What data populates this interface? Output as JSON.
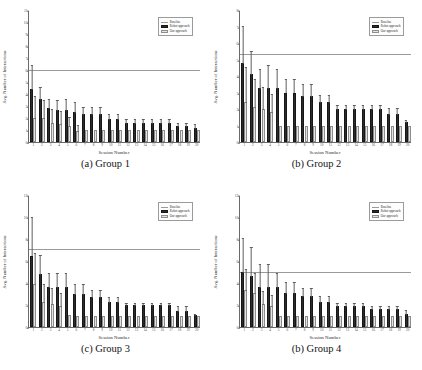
{
  "figure": {
    "panel_count": 4,
    "shared": {
      "xlabel": "Session Number",
      "ylabel": "Avg. Number of Interactions",
      "xticks": [
        "1",
        "2",
        "3",
        "4",
        "5",
        "6",
        "7",
        "8",
        "9",
        "10",
        "11",
        "12",
        "13",
        "14",
        "15",
        "16",
        "17",
        "18",
        "19",
        "20"
      ],
      "legend": [
        {
          "label": "Baseline",
          "type": "line",
          "color": "#9a9a9a"
        },
        {
          "label": "Robot approach",
          "type": "bar",
          "color": "#2b2b2b"
        },
        {
          "label": "Our approach",
          "type": "bar",
          "color": "#e4e4e4"
        }
      ]
    },
    "panels": [
      {
        "caption": "(a) Group 1",
        "chart_data": {
          "type": "bar",
          "title": "(a) Group 1",
          "xlabel": "Session Number",
          "ylabel": "Avg. Number of Interactions",
          "categories": [
            "1",
            "2",
            "3",
            "4",
            "5",
            "6",
            "7",
            "8",
            "9",
            "10",
            "11",
            "12",
            "13",
            "14",
            "15",
            "16",
            "17",
            "18",
            "19",
            "20"
          ],
          "ylim": [
            0,
            11
          ],
          "yticks": [
            0,
            1,
            2,
            3,
            4,
            5,
            6,
            7,
            8,
            9,
            10,
            11
          ],
          "grid": false,
          "legend_position": "top-right",
          "baseline": 6.1,
          "series": [
            {
              "name": "Robot approach",
              "color": "#2b2b2b",
              "values": [
                4.4,
                3.6,
                2.8,
                2.7,
                2.7,
                2.5,
                2.3,
                2.3,
                2.3,
                1.9,
                1.9,
                1.6,
                1.6,
                1.6,
                1.6,
                1.6,
                1.6,
                1.3,
                1.3,
                1.2
              ],
              "errors": [
                2.1,
                1.1,
                0.9,
                0.9,
                1.0,
                0.9,
                0.7,
                0.7,
                0.7,
                0.5,
                0.5,
                0.4,
                0.4,
                0.4,
                0.4,
                0.4,
                0.4,
                0.4,
                0.4,
                0.4
              ]
            },
            {
              "name": "Our approach",
              "color": "#e4e4e4",
              "values": [
                2.0,
                2.0,
                1.6,
                1.5,
                1.3,
                0.9,
                1.0,
                1.0,
                1.0,
                1.0,
                1.0,
                1.0,
                1.0,
                1.0,
                1.0,
                1.0,
                1.0,
                1.0,
                1.0,
                1.0
              ],
              "errors": [
                1.9,
                1.6,
                1.2,
                1.2,
                0.9,
                0.6,
                0.0,
                0.0,
                0.0,
                0.0,
                0.0,
                0.0,
                0.0,
                0.0,
                0.0,
                0.0,
                0.0,
                0.0,
                0.0,
                0.0
              ]
            }
          ]
        }
      },
      {
        "caption": "(b) Group 2",
        "chart_data": {
          "type": "bar",
          "title": "(b) Group 2",
          "xlabel": "Session Number",
          "ylabel": "Avg. Number of Interactions",
          "categories": [
            "1",
            "2",
            "3",
            "4",
            "5",
            "6",
            "7",
            "8",
            "9",
            "10",
            "11",
            "12",
            "13",
            "14",
            "15",
            "16",
            "17",
            "18",
            "19",
            "20"
          ],
          "ylim": [
            0,
            8
          ],
          "yticks": [
            0,
            1,
            2,
            3,
            4,
            5,
            6,
            7,
            8
          ],
          "grid": false,
          "legend_position": "top-right",
          "baseline": 5.4,
          "series": [
            {
              "name": "Robot approach",
              "color": "#2b2b2b",
              "values": [
                4.8,
                4.1,
                3.3,
                3.3,
                3.3,
                3.0,
                3.0,
                2.8,
                2.8,
                2.4,
                2.4,
                2.0,
                2.0,
                2.0,
                2.0,
                2.0,
                2.0,
                1.7,
                1.7,
                1.2
              ],
              "errors": [
                2.3,
                1.5,
                1.2,
                1.4,
                1.2,
                0.9,
                0.9,
                0.8,
                0.8,
                0.5,
                0.5,
                0.3,
                0.3,
                0.3,
                0.3,
                0.3,
                0.3,
                0.4,
                0.4,
                0.2
              ]
            },
            {
              "name": "Our approach",
              "color": "#e4e4e4",
              "values": [
                2.4,
                2.1,
                2.0,
                1.8,
                1.0,
                1.0,
                1.0,
                1.0,
                1.0,
                1.0,
                1.0,
                1.0,
                1.0,
                1.0,
                1.0,
                1.0,
                1.0,
                1.0,
                1.0,
                1.0
              ],
              "errors": [
                2.2,
                1.8,
                1.4,
                1.2,
                0.0,
                0.0,
                0.0,
                0.0,
                0.0,
                0.0,
                0.0,
                0.0,
                0.0,
                0.0,
                0.0,
                0.0,
                0.0,
                0.0,
                0.0,
                0.0
              ]
            }
          ]
        }
      },
      {
        "caption": "(c) Group 3",
        "chart_data": {
          "type": "bar",
          "title": "(c) Group 3",
          "xlabel": "Session Number",
          "ylabel": "Avg. Number of Interactions",
          "categories": [
            "1",
            "2",
            "3",
            "4",
            "5",
            "6",
            "7",
            "8",
            "9",
            "10",
            "11",
            "12",
            "13",
            "14",
            "15",
            "16",
            "17",
            "18",
            "19",
            "20"
          ],
          "ylim": [
            0,
            12
          ],
          "yticks": [
            0,
            2,
            4,
            6,
            8,
            10,
            12
          ],
          "grid": false,
          "legend_position": "top-right",
          "baseline": 7.2,
          "series": [
            {
              "name": "Robot approach",
              "color": "#2b2b2b",
              "values": [
                6.5,
                4.8,
                3.6,
                3.6,
                3.6,
                3.0,
                3.0,
                2.7,
                2.7,
                2.3,
                2.3,
                2.0,
                2.0,
                2.0,
                2.0,
                2.0,
                2.0,
                1.5,
                1.5,
                1.1
              ],
              "errors": [
                3.6,
                1.8,
                1.4,
                1.4,
                1.4,
                1.0,
                1.0,
                0.8,
                0.8,
                0.5,
                0.5,
                0.3,
                0.3,
                0.3,
                0.3,
                0.3,
                0.3,
                0.5,
                0.5,
                0.2
              ]
            },
            {
              "name": "Our approach",
              "color": "#e4e4e4",
              "values": [
                3.9,
                2.3,
                2.1,
                1.9,
                1.1,
                1.0,
                1.0,
                1.0,
                1.0,
                1.0,
                1.0,
                1.0,
                1.0,
                1.0,
                1.0,
                1.0,
                1.0,
                1.0,
                1.0,
                1.0
              ],
              "errors": [
                2.9,
                1.7,
                1.5,
                1.3,
                0.0,
                0.0,
                0.0,
                0.0,
                0.0,
                0.0,
                0.0,
                0.0,
                0.0,
                0.0,
                0.0,
                0.0,
                0.0,
                0.0,
                0.0,
                0.0
              ]
            }
          ]
        }
      },
      {
        "caption": "(b) Group 4",
        "chart_data": {
          "type": "bar",
          "title": "(b) Group 4",
          "xlabel": "Session Number",
          "ylabel": "Avg. Number of Interactions",
          "categories": [
            "1",
            "2",
            "3",
            "4",
            "5",
            "6",
            "7",
            "8",
            "9",
            "10",
            "11",
            "12",
            "13",
            "14",
            "15",
            "16",
            "17",
            "18",
            "19",
            "20"
          ],
          "ylim": [
            0,
            12
          ],
          "yticks": [
            0,
            2,
            4,
            6,
            8,
            10,
            12
          ],
          "grid": false,
          "legend_position": "top-right",
          "baseline": 5.1,
          "series": [
            {
              "name": "Robot approach",
              "color": "#2b2b2b",
              "values": [
                5.0,
                4.6,
                3.6,
                3.6,
                3.6,
                3.1,
                3.1,
                2.8,
                2.8,
                2.3,
                2.3,
                1.9,
                1.9,
                1.9,
                1.9,
                1.6,
                1.6,
                1.6,
                1.6,
                1.2
              ],
              "errors": [
                3.2,
                2.8,
                2.2,
                2.2,
                1.4,
                1.1,
                1.1,
                0.8,
                0.8,
                0.6,
                0.6,
                0.4,
                0.4,
                0.4,
                0.4,
                0.4,
                0.4,
                0.4,
                0.4,
                0.4
              ]
            },
            {
              "name": "Our approach",
              "color": "#e4e4e4",
              "values": [
                3.4,
                3.1,
                2.1,
                1.9,
                1.0,
                1.0,
                1.0,
                1.0,
                1.0,
                1.0,
                1.0,
                1.0,
                1.0,
                1.0,
                1.0,
                1.0,
                1.0,
                1.0,
                1.0,
                1.0
              ],
              "errors": [
                2.0,
                1.9,
                1.3,
                1.1,
                0.0,
                0.0,
                0.0,
                0.0,
                0.0,
                0.0,
                0.0,
                0.0,
                0.0,
                0.0,
                0.0,
                0.0,
                0.0,
                0.0,
                0.0,
                0.0
              ]
            }
          ]
        }
      }
    ]
  }
}
